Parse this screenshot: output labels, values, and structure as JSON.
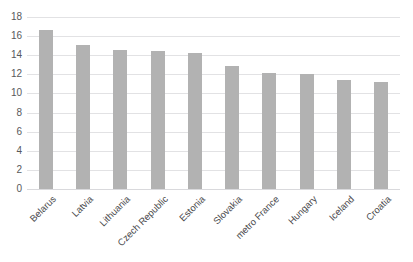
{
  "chart_data": {
    "type": "bar",
    "title": "",
    "subtitle": "",
    "xlabel": "",
    "ylabel": "",
    "categories": [
      "Belarus",
      "Latvia",
      "Lithuania",
      "Czech Republic",
      "Estonia",
      "Slovakia",
      "metro France",
      "Hungary",
      "Iceland",
      "Croatia"
    ],
    "values": [
      16.6,
      15.1,
      14.5,
      14.4,
      14.2,
      12.9,
      12.1,
      12.0,
      11.4,
      11.2
    ],
    "ylim": [
      0,
      18
    ],
    "yticks": [
      0,
      2,
      4,
      6,
      8,
      10,
      12,
      14,
      16,
      18
    ],
    "ytick_labels": [
      "0",
      "2",
      "4",
      "6",
      "8",
      "10",
      "12",
      "14",
      "16",
      "18"
    ],
    "grid": true,
    "legend": false,
    "legend_position": "none",
    "series": [
      {
        "name": "",
        "color": "#b2b2b2",
        "values": [
          16.6,
          15.1,
          14.5,
          14.4,
          14.2,
          12.9,
          12.1,
          12.0,
          11.4,
          11.2
        ]
      }
    ]
  },
  "style": {
    "bar_color": "#b2b2b2",
    "gridline_color": "#e2e2e4",
    "axis_text_color": "#58595b",
    "category_text_color": "#4a4a4c",
    "background": "#ffffff"
  }
}
